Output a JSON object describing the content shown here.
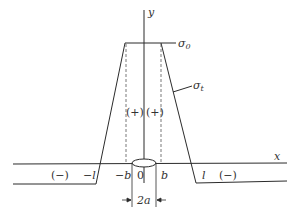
{
  "diagram": {
    "axes": {
      "x_label": "x",
      "y_label": "y"
    },
    "labels": {
      "sigma0": "σ",
      "sigma0_sub": "0",
      "sigmat": "σ",
      "sigmat_sub": "t",
      "plus_left": "(+)",
      "plus_right": "(+)",
      "minus_left": "(−)",
      "minus_right": "(−)",
      "neg_l": "−l",
      "neg_b": "−b",
      "origin": "0",
      "b": "b",
      "l": "l",
      "width": "2a"
    },
    "colors": {
      "line": "#2b2b2b",
      "dash": "#555555"
    }
  }
}
